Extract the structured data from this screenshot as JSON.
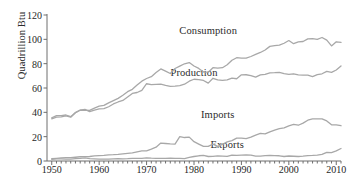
{
  "chart_data": {
    "type": "line",
    "title": "",
    "xlabel": "",
    "ylabel": "Quadrillion Btu",
    "xlim": [
      1949,
      2011
    ],
    "ylim": [
      0,
      120
    ],
    "yticks": [
      0,
      20,
      40,
      60,
      80,
      100,
      120
    ],
    "xticks": [
      1950,
      1960,
      1970,
      1980,
      1990,
      2000,
      2010
    ],
    "grid": false,
    "legend_position": "inline-annotations",
    "line_color": "#a8a8a8",
    "text_color": "#2b2b2b",
    "axis_color": "#6e6e6e",
    "x": [
      1950,
      1951,
      1952,
      1953,
      1954,
      1955,
      1956,
      1957,
      1958,
      1959,
      1960,
      1961,
      1962,
      1963,
      1964,
      1965,
      1966,
      1967,
      1968,
      1969,
      1970,
      1971,
      1972,
      1973,
      1974,
      1975,
      1976,
      1977,
      1978,
      1979,
      1980,
      1981,
      1982,
      1983,
      1984,
      1985,
      1986,
      1987,
      1988,
      1989,
      1990,
      1991,
      1992,
      1993,
      1994,
      1995,
      1996,
      1997,
      1998,
      1999,
      2000,
      2001,
      2002,
      2003,
      2004,
      2005,
      2006,
      2007,
      2008,
      2009,
      2010,
      2011
    ],
    "series": [
      {
        "name": "Consumption",
        "label_x": 1983,
        "label_y": 108,
        "values": [
          34.6,
          36.0,
          36.2,
          37.0,
          36.0,
          39.7,
          41.7,
          41.8,
          41.6,
          43.5,
          45.1,
          45.7,
          47.8,
          49.6,
          51.5,
          54.0,
          57.0,
          58.9,
          62.4,
          65.6,
          67.8,
          69.3,
          72.7,
          75.7,
          73.9,
          71.9,
          76.0,
          78.0,
          79.9,
          80.9,
          78.1,
          76.1,
          73.1,
          73.0,
          76.7,
          76.4,
          76.7,
          79.1,
          82.8,
          84.9,
          84.6,
          84.5,
          85.9,
          87.6,
          89.2,
          91.2,
          94.2,
          94.8,
          95.2,
          96.8,
          99.0,
          96.4,
          97.9,
          98.2,
          100.4,
          100.5,
          99.9,
          101.5,
          99.3,
          94.6,
          98.0,
          97.5
        ]
      },
      {
        "name": "Production",
        "label_x": 1980,
        "label_y": 73,
        "values": [
          35.5,
          37.3,
          37.3,
          37.8,
          36.4,
          39.8,
          41.9,
          42.4,
          40.5,
          41.8,
          42.8,
          43.1,
          44.6,
          46.9,
          48.5,
          49.8,
          52.6,
          55.5,
          56.3,
          58.1,
          63.5,
          62.8,
          63.0,
          63.1,
          62.1,
          61.4,
          61.6,
          62.0,
          63.1,
          65.6,
          67.2,
          66.9,
          66.2,
          64.0,
          68.0,
          66.7,
          66.2,
          66.6,
          68.1,
          67.6,
          70.8,
          70.9,
          70.2,
          68.9,
          70.8,
          71.2,
          72.5,
          72.6,
          72.9,
          71.8,
          71.2,
          71.7,
          70.8,
          70.5,
          70.6,
          69.4,
          71.0,
          71.7,
          73.7,
          72.9,
          74.8,
          78.1
        ]
      },
      {
        "name": "Imports",
        "label_x": 1985,
        "label_y": 39,
        "values": [
          1.9,
          2.2,
          2.5,
          2.7,
          2.7,
          3.1,
          3.5,
          3.6,
          3.7,
          4.2,
          4.5,
          4.6,
          5.0,
          5.2,
          5.5,
          5.9,
          6.3,
          6.6,
          7.5,
          8.4,
          8.4,
          9.8,
          11.4,
          14.7,
          14.4,
          14.1,
          13.9,
          20.0,
          19.3,
          19.6,
          15.9,
          13.9,
          12.0,
          12.0,
          13.9,
          12.0,
          13.7,
          15.7,
          16.7,
          18.8,
          18.8,
          18.4,
          19.6,
          21.3,
          22.7,
          22.3,
          24.0,
          25.4,
          26.6,
          27.3,
          28.9,
          30.1,
          29.4,
          31.1,
          33.5,
          34.7,
          34.7,
          34.6,
          32.9,
          29.7,
          29.7,
          29.0
        ]
      },
      {
        "name": "Exports",
        "label_x": 1987,
        "label_y": 14,
        "values": [
          1.4,
          1.8,
          1.8,
          1.5,
          1.5,
          1.9,
          2.2,
          2.6,
          2.0,
          1.8,
          1.5,
          1.5,
          1.6,
          1.8,
          1.9,
          1.8,
          1.9,
          2.2,
          2.1,
          2.2,
          2.6,
          2.3,
          2.2,
          2.1,
          2.2,
          2.4,
          2.2,
          2.1,
          1.9,
          2.9,
          3.7,
          4.3,
          4.6,
          3.7,
          3.8,
          4.2,
          4.0,
          3.8,
          4.9,
          4.6,
          4.8,
          5.0,
          4.9,
          4.0,
          4.0,
          4.5,
          4.6,
          4.5,
          4.3,
          3.7,
          4.1,
          3.9,
          3.7,
          4.0,
          4.4,
          4.6,
          4.9,
          5.4,
          7.1,
          6.9,
          8.3,
          10.3
        ]
      }
    ]
  }
}
